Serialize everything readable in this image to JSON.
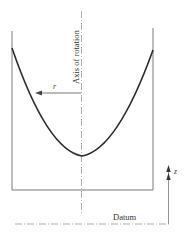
{
  "diagram": {
    "type": "rotating-fluid-container",
    "labels": {
      "axis": "Axis of rotation",
      "radius": "r",
      "datum": "Datum",
      "height": "z"
    },
    "colors": {
      "wall": "#7a7a7a",
      "free_surface": "#2b2b2b",
      "axis": "#9a9a9a",
      "text": "#333333"
    }
  }
}
